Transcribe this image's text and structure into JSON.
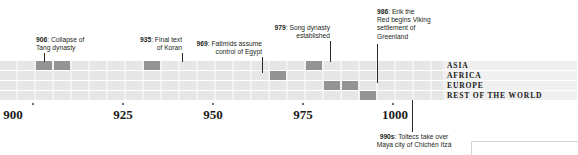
{
  "chart_data": {
    "type": "timeline",
    "title": "",
    "xlabel": "",
    "ylabel": "",
    "xlim": [
      896,
      1008
    ],
    "axis_ticks": [
      {
        "label": "900",
        "value": 900
      },
      {
        "label": "925",
        "value": 925
      },
      {
        "label": "950",
        "value": 950
      },
      {
        "label": "975",
        "value": 975
      },
      {
        "label": "1000",
        "value": 1000
      }
    ],
    "rows": [
      {
        "label": "ASIA"
      },
      {
        "label": "AFRICA"
      },
      {
        "label": "EUROPE"
      },
      {
        "label": "REST OF THE WORLD"
      }
    ],
    "events": [
      {
        "year_label": "906",
        "year": 906,
        "text": "Collapse of Tang dynasty",
        "row": "ASIA",
        "row_index": 0,
        "align": "left",
        "position": "above"
      },
      {
        "year_label": "935",
        "year": 935,
        "text": "Final text of Koran",
        "row": "ASIA",
        "row_index": 0,
        "align": "right",
        "position": "above"
      },
      {
        "year_label": "969",
        "year": 969,
        "text": "Fatimids assume control of Egypt",
        "row": "AFRICA",
        "row_index": 1,
        "align": "right",
        "position": "above"
      },
      {
        "year_label": "979",
        "year": 979,
        "text": "Song dynasty established",
        "row": "ASIA",
        "row_index": 0,
        "align": "right",
        "position": "above"
      },
      {
        "year_label": "986",
        "year": 986,
        "text": "Erik the Red begins Viking settlement of Greenland",
        "row": "EUROPE",
        "row_index": 2,
        "align": "left",
        "position": "above"
      },
      {
        "year_label": "990s",
        "year": 995,
        "text": "Toltecs take over Maya city of Chichén Itzá",
        "row": "REST OF THE WORLD",
        "row_index": 3,
        "align": "center",
        "position": "below"
      }
    ],
    "grid": {
      "columns": 25,
      "highlight_color": "#949494",
      "cell_color": "#e6e6e6",
      "row_bg_color": "#f2f2f2"
    }
  },
  "callouts": {
    "c906": {
      "year": "906",
      "line1": "Collapse of",
      "line2": "Tang dynasty"
    },
    "c935": {
      "year": "935",
      "line1": "Final text",
      "line2": "of Koran"
    },
    "c969": {
      "year": "969",
      "line1": "Fatimids assume",
      "line2": "control of Egypt"
    },
    "c979": {
      "year": "979",
      "line1": "Song dynasty",
      "line2": "established"
    },
    "c986": {
      "year": "986",
      "line1": "Erik the",
      "line2": "Red begins Viking",
      "line3": "settlement of",
      "line4": "Greenland"
    },
    "c990": {
      "year": "990s",
      "line1": "Toltecs take over",
      "line2": "Maya city of Chichén Itzá"
    }
  },
  "regions": {
    "asia": "ASIA",
    "africa": "AFRICA",
    "europe": "EUROPE",
    "rest": "REST OF THE WORLD"
  },
  "axis": {
    "t900": "900",
    "t925": "925",
    "t950": "950",
    "t975": "975",
    "t1000": "1000"
  }
}
